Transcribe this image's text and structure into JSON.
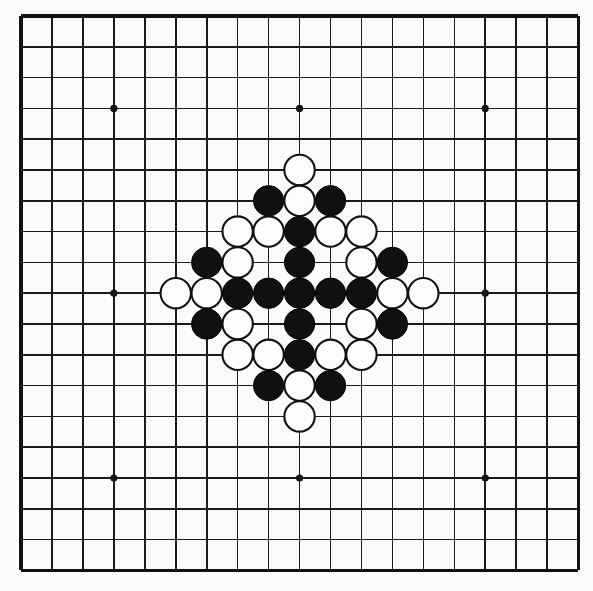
{
  "figure": {
    "caption": "",
    "background_color": "#fbfbf9"
  },
  "board": {
    "name": "go-board",
    "size": 19,
    "columns": 19,
    "rows": 19,
    "line_color": "#1b1b1b",
    "border_color": "#111111",
    "grid_origin_x": 21,
    "grid_origin_y": 16,
    "cell_width": 30.95,
    "cell_height": 30.8,
    "stone_radius": 15.2,
    "hoshi_radius": 3.6,
    "hoshi_points": [
      {
        "col": 3,
        "row": 3
      },
      {
        "col": 9,
        "row": 3
      },
      {
        "col": 15,
        "row": 3
      },
      {
        "col": 3,
        "row": 9
      },
      {
        "col": 9,
        "row": 9
      },
      {
        "col": 15,
        "row": 9
      },
      {
        "col": 3,
        "row": 15
      },
      {
        "col": 9,
        "row": 15
      },
      {
        "col": 15,
        "row": 15
      }
    ],
    "stone_colors": {
      "black": "#101010",
      "white": "#fdfdfb",
      "white_outline": "#111111"
    },
    "counts": {
      "black": 22,
      "white": 25,
      "total": 47
    },
    "stones": [
      {
        "col": 9,
        "row": 5,
        "color": "white"
      },
      {
        "col": 8,
        "row": 6,
        "color": "black"
      },
      {
        "col": 9,
        "row": 6,
        "color": "white"
      },
      {
        "col": 10,
        "row": 6,
        "color": "black"
      },
      {
        "col": 7,
        "row": 7,
        "color": "white"
      },
      {
        "col": 8,
        "row": 7,
        "color": "white"
      },
      {
        "col": 9,
        "row": 7,
        "color": "black"
      },
      {
        "col": 10,
        "row": 7,
        "color": "white"
      },
      {
        "col": 11,
        "row": 7,
        "color": "white"
      },
      {
        "col": 6,
        "row": 8,
        "color": "black"
      },
      {
        "col": 7,
        "row": 8,
        "color": "white"
      },
      {
        "col": 9,
        "row": 8,
        "color": "black"
      },
      {
        "col": 11,
        "row": 8,
        "color": "white"
      },
      {
        "col": 12,
        "row": 8,
        "color": "black"
      },
      {
        "col": 5,
        "row": 9,
        "color": "white"
      },
      {
        "col": 6,
        "row": 9,
        "color": "white"
      },
      {
        "col": 7,
        "row": 9,
        "color": "black"
      },
      {
        "col": 8,
        "row": 9,
        "color": "black"
      },
      {
        "col": 9,
        "row": 9,
        "color": "black"
      },
      {
        "col": 10,
        "row": 9,
        "color": "black"
      },
      {
        "col": 11,
        "row": 9,
        "color": "black"
      },
      {
        "col": 12,
        "row": 9,
        "color": "white"
      },
      {
        "col": 13,
        "row": 9,
        "color": "white"
      },
      {
        "col": 6,
        "row": 10,
        "color": "black"
      },
      {
        "col": 7,
        "row": 10,
        "color": "white"
      },
      {
        "col": 9,
        "row": 10,
        "color": "black"
      },
      {
        "col": 11,
        "row": 10,
        "color": "white"
      },
      {
        "col": 12,
        "row": 10,
        "color": "black"
      },
      {
        "col": 7,
        "row": 11,
        "color": "white"
      },
      {
        "col": 8,
        "row": 11,
        "color": "white"
      },
      {
        "col": 9,
        "row": 11,
        "color": "black"
      },
      {
        "col": 10,
        "row": 11,
        "color": "white"
      },
      {
        "col": 11,
        "row": 11,
        "color": "white"
      },
      {
        "col": 8,
        "row": 12,
        "color": "black"
      },
      {
        "col": 9,
        "row": 12,
        "color": "white"
      },
      {
        "col": 10,
        "row": 12,
        "color": "black"
      },
      {
        "col": 9,
        "row": 13,
        "color": "white"
      }
    ]
  }
}
